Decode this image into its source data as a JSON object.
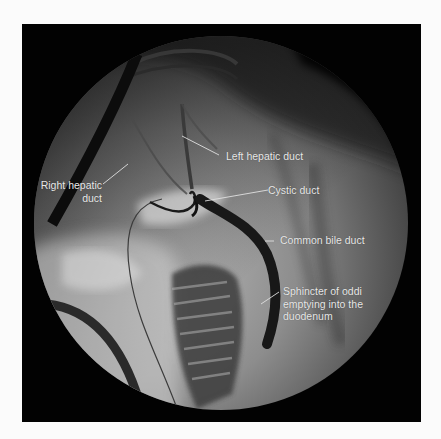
{
  "figure": {
    "type": "fluoroscopic cholangiogram",
    "labels": {
      "left_hepatic_duct": "Left hepatic duct",
      "right_hepatic_duct": "Right hepatic\nduct",
      "cystic_duct": "Cystic duct",
      "common_bile_duct": "Common bile duct",
      "sphincter_of_oddi": "Sphincter of oddi\nemptying into the\nduodenum"
    },
    "colors": {
      "page_background": "#fbfbfb",
      "frame_background": "#020202",
      "label_text": "#e8e8e8",
      "leader_line": "#e0e0e0"
    }
  }
}
